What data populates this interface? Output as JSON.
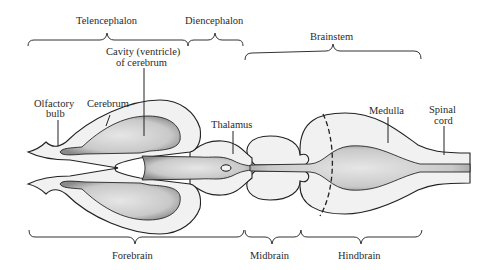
{
  "diagram": {
    "type": "anatomical-diagram",
    "top_braces": [
      {
        "label": "Telencephalon"
      },
      {
        "label": "Diencephalon"
      },
      {
        "label": "Brainstem"
      }
    ],
    "bottom_braces": [
      {
        "label": "Forebrain"
      },
      {
        "label": "Midbrain"
      },
      {
        "label": "Hindbrain"
      }
    ],
    "structure_labels": {
      "cavity_line1": "Cavity (ventricle)",
      "cavity_line2": "of cerebrum",
      "olfactory_line1": "Olfactory",
      "olfactory_line2": "bulb",
      "cerebrum": "Cerebrum",
      "thalamus": "Thalamus",
      "medulla": "Medulla",
      "spinal_line1": "Spinal",
      "spinal_line2": "cord"
    }
  }
}
